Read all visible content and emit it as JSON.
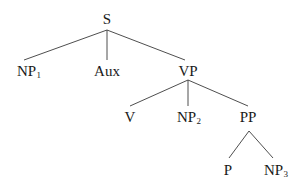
{
  "diagram": {
    "type": "syntax-tree",
    "nodes": {
      "s": {
        "label": "S",
        "sub": ""
      },
      "np1": {
        "label": "NP",
        "sub": "1"
      },
      "aux": {
        "label": "Aux",
        "sub": ""
      },
      "vp": {
        "label": "VP",
        "sub": ""
      },
      "v": {
        "label": "V",
        "sub": ""
      },
      "np2": {
        "label": "NP",
        "sub": "2"
      },
      "pp": {
        "label": "PP",
        "sub": ""
      },
      "p": {
        "label": "P",
        "sub": ""
      },
      "np3": {
        "label": "NP",
        "sub": "3"
      }
    },
    "edges": [
      [
        "S",
        "NP1"
      ],
      [
        "S",
        "Aux"
      ],
      [
        "S",
        "VP"
      ],
      [
        "VP",
        "V"
      ],
      [
        "VP",
        "NP2"
      ],
      [
        "VP",
        "PP"
      ],
      [
        "PP",
        "P"
      ],
      [
        "PP",
        "NP3"
      ]
    ],
    "line_color": "#3a3a3a",
    "text_color": "#1a1a1a"
  }
}
